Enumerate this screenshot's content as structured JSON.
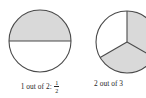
{
  "figure": {
    "background_color": "#ffffff",
    "stroke_color": "#4a4a4a",
    "shaded_fill": "#d9d9d9",
    "unshaded_fill": "#ffffff",
    "text_color": "#262626",
    "items": [
      {
        "id": "one-of-two",
        "shape": "circle",
        "total_parts": 2,
        "shaded_parts": 1,
        "caption_text": "1 out of 2:",
        "fraction_numerator": "1",
        "fraction_denominator": "2",
        "shaded_positions": [
          "top-half"
        ],
        "unshaded_positions": [
          "bottom-half"
        ],
        "divider_lines": 1,
        "center_x": 40,
        "center_y": 41,
        "radius": 31
      },
      {
        "id": "two-of-three",
        "shape": "circle",
        "total_parts": 3,
        "shaded_parts": 2,
        "caption_text": "2 out of 3",
        "fraction_numerator": "2",
        "fraction_denominator": "3",
        "shaded_positions": [
          "upper-right-third",
          "bottom-third"
        ],
        "unshaded_positions": [
          "left-third"
        ],
        "divider_lines": 3,
        "center_x": 47,
        "center_y": 42,
        "radius": 31,
        "clipped_at_right_edge": true
      }
    ]
  }
}
